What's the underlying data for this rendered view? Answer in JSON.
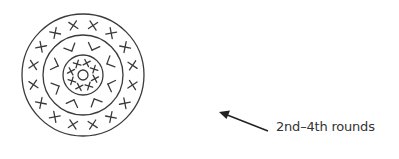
{
  "diagram": {
    "annotation": {
      "label": "2nd–4th rounds",
      "arrow_from": [
        268,
        131
      ],
      "arrow_to": [
        220,
        112
      ]
    },
    "center": [
      83,
      75
    ],
    "rings": [
      {
        "name": "center-ring",
        "radius": 5
      },
      {
        "name": "round-2-ring",
        "radius": 20,
        "stitch": "x",
        "count": 8
      },
      {
        "name": "round-3-ring",
        "radius": 40,
        "stitch": "v",
        "count": 8
      },
      {
        "name": "round-4-ring",
        "radius": 61,
        "stitch": "x",
        "count": 16
      }
    ],
    "colors": {
      "line": "#3a3a3a",
      "background": "#ffffff",
      "text": "#333333"
    }
  }
}
